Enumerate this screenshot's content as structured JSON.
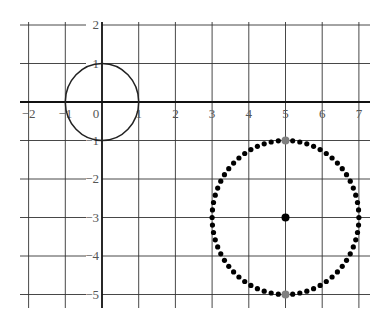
{
  "chart_data": {
    "type": "scatter",
    "title": "",
    "xlabel": "",
    "ylabel": "",
    "xlim": [
      -2,
      7
    ],
    "ylim": [
      -5,
      2
    ],
    "grid": true,
    "x_ticks": [
      -2,
      -1,
      0,
      1,
      2,
      3,
      4,
      5,
      6,
      7
    ],
    "y_ticks": [
      2,
      1,
      -1,
      -2,
      -3,
      -4,
      -5
    ],
    "x_tick_labels": [
      "−2",
      "−1",
      "0",
      "1",
      "2",
      "3",
      "4",
      "5",
      "6",
      "7"
    ],
    "y_tick_labels": [
      "2",
      "1",
      "−1",
      "−2",
      "−3",
      "−4",
      "−5"
    ],
    "series": [
      {
        "name": "unit circle",
        "kind": "solid-circle",
        "center": [
          0,
          0
        ],
        "radius": 1,
        "color": "#222222"
      },
      {
        "name": "dotted circle",
        "kind": "dotted-circle",
        "center": [
          5,
          -3
        ],
        "radius": 2,
        "dot_count": 64,
        "color": "#000000"
      },
      {
        "name": "center point",
        "kind": "point",
        "points": [
          [
            5,
            -3
          ]
        ],
        "color": "#000000"
      },
      {
        "name": "highlighted points",
        "kind": "point",
        "points": [
          [
            5,
            -1
          ],
          [
            5,
            -5
          ]
        ],
        "color": "#808080"
      }
    ]
  },
  "colors": {
    "grid": "#333333",
    "axis": "#111111",
    "tick_label": "#555555",
    "highlight": "#808080"
  }
}
